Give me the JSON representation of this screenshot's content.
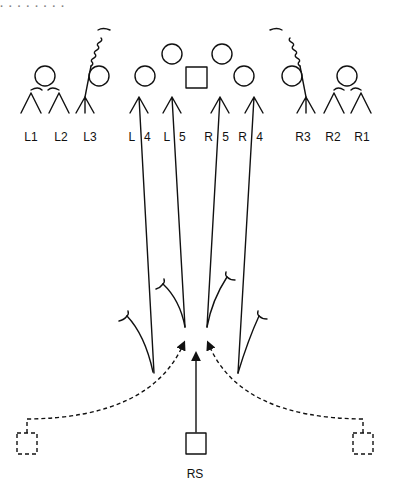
{
  "header": {
    "partial_text": "· · · · · · · ·"
  },
  "players": {
    "labels": [
      {
        "id": "L1",
        "x": 31,
        "y": 131
      },
      {
        "id": "L2",
        "x": 61,
        "y": 131
      },
      {
        "id": "L3",
        "x": 90,
        "y": 131
      },
      {
        "id": "L 4",
        "x": 141,
        "y": 131
      },
      {
        "id": "L 5",
        "x": 176,
        "y": 131
      },
      {
        "id": "R 5",
        "x": 218,
        "y": 131
      },
      {
        "id": "R 4",
        "x": 252,
        "y": 131
      },
      {
        "id": "R3",
        "x": 303,
        "y": 131
      },
      {
        "id": "R2",
        "x": 333,
        "y": 131
      },
      {
        "id": "R1",
        "x": 362,
        "y": 131
      }
    ],
    "receiver": {
      "id": "RS",
      "x": 195,
      "y": 473
    }
  },
  "colors": {
    "ink": "#111111",
    "background": "#ffffff"
  }
}
